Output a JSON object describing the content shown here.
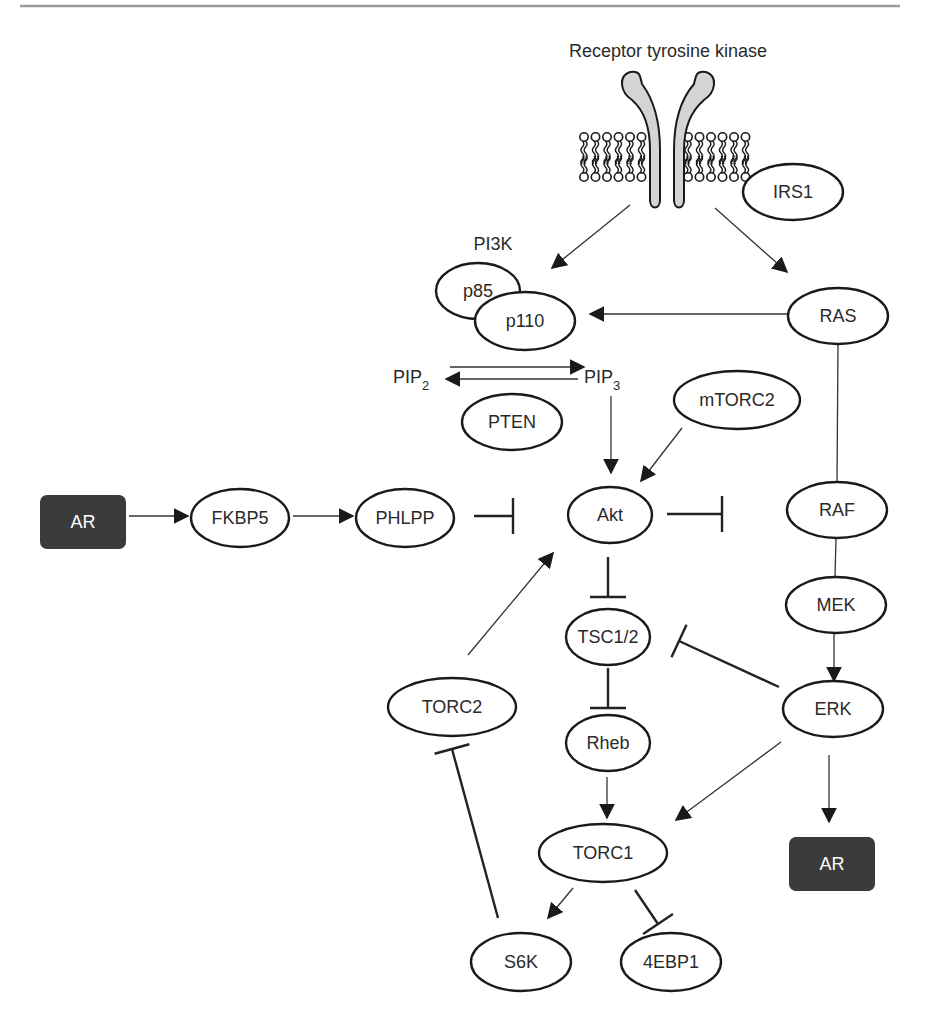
{
  "colors": {
    "box_fill": "#3b3b3b",
    "stroke": "#1a1a1a",
    "receptor_fill": "#d4d4d4",
    "rule": "#9a9a9a"
  },
  "header": {
    "receptor_label": "Receptor tyrosine kinase",
    "pi3k_label": "PI3K"
  },
  "nodes": [
    {
      "id": "irs1",
      "label": "IRS1",
      "shape": "ellipse",
      "cx": 793,
      "cy": 192,
      "rx": 50,
      "ry": 28
    },
    {
      "id": "p85",
      "label": "p85",
      "shape": "ellipse",
      "cx": 478,
      "cy": 291,
      "rx": 42,
      "ry": 28
    },
    {
      "id": "p110",
      "label": "p110",
      "shape": "ellipse",
      "cx": 525,
      "cy": 321,
      "rx": 50,
      "ry": 29
    },
    {
      "id": "ras",
      "label": "RAS",
      "shape": "ellipse",
      "cx": 838,
      "cy": 316,
      "rx": 50,
      "ry": 28
    },
    {
      "id": "pten",
      "label": "PTEN",
      "shape": "ellipse",
      "cx": 512,
      "cy": 422,
      "rx": 50,
      "ry": 28
    },
    {
      "id": "mtorc2",
      "label": "mTORC2",
      "shape": "ellipse",
      "cx": 737,
      "cy": 400,
      "rx": 63,
      "ry": 29
    },
    {
      "id": "fkbp5",
      "label": "FKBP5",
      "shape": "ellipse",
      "cx": 240,
      "cy": 518,
      "rx": 49,
      "ry": 29
    },
    {
      "id": "phlpp",
      "label": "PHLPP",
      "shape": "ellipse",
      "cx": 405,
      "cy": 518,
      "rx": 49,
      "ry": 29
    },
    {
      "id": "akt",
      "label": "Akt",
      "shape": "ellipse",
      "cx": 610,
      "cy": 515,
      "rx": 42,
      "ry": 28
    },
    {
      "id": "raf",
      "label": "RAF",
      "shape": "ellipse",
      "cx": 837,
      "cy": 510,
      "rx": 50,
      "ry": 28
    },
    {
      "id": "mek",
      "label": "MEK",
      "shape": "ellipse",
      "cx": 836,
      "cy": 605,
      "rx": 50,
      "ry": 28
    },
    {
      "id": "tsc12",
      "label": "TSC1/2",
      "shape": "ellipse",
      "cx": 608,
      "cy": 637,
      "rx": 42,
      "ry": 28
    },
    {
      "id": "erk",
      "label": "ERK",
      "shape": "ellipse",
      "cx": 833,
      "cy": 709,
      "rx": 50,
      "ry": 28
    },
    {
      "id": "torc2",
      "label": "TORC2",
      "shape": "ellipse",
      "cx": 452,
      "cy": 707,
      "rx": 64,
      "ry": 29
    },
    {
      "id": "rheb",
      "label": "Rheb",
      "shape": "ellipse",
      "cx": 608,
      "cy": 743,
      "rx": 42,
      "ry": 28
    },
    {
      "id": "torc1",
      "label": "TORC1",
      "shape": "ellipse",
      "cx": 603,
      "cy": 853,
      "rx": 64,
      "ry": 29
    },
    {
      "id": "s6k",
      "label": "S6K",
      "shape": "ellipse",
      "cx": 521,
      "cy": 962,
      "rx": 50,
      "ry": 29
    },
    {
      "id": "4ebp1",
      "label": "4EBP1",
      "shape": "ellipse",
      "cx": 671,
      "cy": 962,
      "rx": 50,
      "ry": 29
    }
  ],
  "boxes": [
    {
      "id": "ar-left",
      "label": "AR",
      "x": 40,
      "y": 495,
      "w": 86,
      "h": 54
    },
    {
      "id": "ar-right",
      "label": "AR",
      "x": 789,
      "y": 837,
      "w": 86,
      "h": 54
    }
  ],
  "metabolites": {
    "pip2": {
      "base": "PIP",
      "sub": "2",
      "x": 393,
      "y": 383
    },
    "pip3": {
      "base": "PIP",
      "sub": "3",
      "x": 584,
      "y": 383
    }
  },
  "edges": [
    {
      "from": "receptor",
      "to": "p110",
      "type": "activation",
      "x1": 630,
      "y1": 205,
      "x2": 552,
      "y2": 268
    },
    {
      "from": "receptor",
      "to": "ras",
      "type": "activation",
      "x1": 715,
      "y1": 208,
      "x2": 787,
      "y2": 272
    },
    {
      "from": "ras",
      "to": "p110",
      "type": "activation",
      "x1": 787,
      "y1": 314,
      "x2": 590,
      "y2": 314
    },
    {
      "from": "pip2",
      "to": "pip3",
      "type": "activation",
      "x1": 450,
      "y1": 367,
      "x2": 584,
      "y2": 367
    },
    {
      "from": "pip3",
      "to": "pip2",
      "type": "activation",
      "x1": 578,
      "y1": 379,
      "x2": 446,
      "y2": 379
    },
    {
      "from": "pip3",
      "to": "akt",
      "type": "activation",
      "x1": 611,
      "y1": 396,
      "x2": 611,
      "y2": 473
    },
    {
      "from": "mtorc2",
      "to": "akt",
      "type": "activation",
      "x1": 682,
      "y1": 428,
      "x2": 641,
      "y2": 481
    },
    {
      "from": "ar-left",
      "to": "fkbp5",
      "type": "activation",
      "x1": 129,
      "y1": 516,
      "x2": 188,
      "y2": 516
    },
    {
      "from": "fkbp5",
      "to": "phlpp",
      "type": "activation",
      "x1": 293,
      "y1": 516,
      "x2": 353,
      "y2": 516
    },
    {
      "from": "phlpp",
      "to": "akt",
      "type": "inhibition",
      "x1": 474,
      "y1": 516,
      "x2": 513,
      "y2": 516
    },
    {
      "from": "akt",
      "to": "raf",
      "type": "inhibition",
      "x1": 667,
      "y1": 514,
      "x2": 722,
      "y2": 514
    },
    {
      "from": "ras",
      "to": "raf",
      "type": "line",
      "x1": 838,
      "y1": 344,
      "x2": 837,
      "y2": 482
    },
    {
      "from": "raf",
      "to": "mek",
      "type": "line",
      "x1": 836,
      "y1": 538,
      "x2": 835,
      "y2": 577
    },
    {
      "from": "mek",
      "to": "erk",
      "type": "activation",
      "x1": 834,
      "y1": 633,
      "x2": 834,
      "y2": 681
    },
    {
      "from": "akt",
      "to": "tsc12",
      "type": "inhibition",
      "x1": 608,
      "y1": 557,
      "x2": 608,
      "y2": 597
    },
    {
      "from": "erk",
      "to": "tsc12",
      "type": "inhibition",
      "x1": 779,
      "y1": 687,
      "x2": 679,
      "y2": 641
    },
    {
      "from": "tsc12",
      "to": "rheb",
      "type": "inhibition",
      "x1": 608,
      "y1": 668,
      "x2": 608,
      "y2": 708
    },
    {
      "from": "rheb",
      "to": "torc1",
      "type": "activation",
      "x1": 607,
      "y1": 777,
      "x2": 607,
      "y2": 818
    },
    {
      "from": "erk",
      "to": "torc1",
      "type": "activation",
      "x1": 781,
      "y1": 742,
      "x2": 676,
      "y2": 820
    },
    {
      "from": "erk",
      "to": "ar-right",
      "type": "activation",
      "x1": 829,
      "y1": 755,
      "x2": 829,
      "y2": 822
    },
    {
      "from": "torc2",
      "to": "akt",
      "type": "activation",
      "x1": 468,
      "y1": 655,
      "x2": 553,
      "y2": 553
    },
    {
      "from": "s6k",
      "to": "torc2",
      "type": "inhibition-thick",
      "x1": 498,
      "y1": 918,
      "x2": 452,
      "y2": 749
    },
    {
      "from": "torc1",
      "to": "s6k",
      "type": "activation",
      "x1": 573,
      "y1": 888,
      "x2": 548,
      "y2": 918
    },
    {
      "from": "torc1",
      "to": "4ebp1",
      "type": "inhibition",
      "x1": 635,
      "y1": 890,
      "x2": 658,
      "y2": 924
    }
  ]
}
